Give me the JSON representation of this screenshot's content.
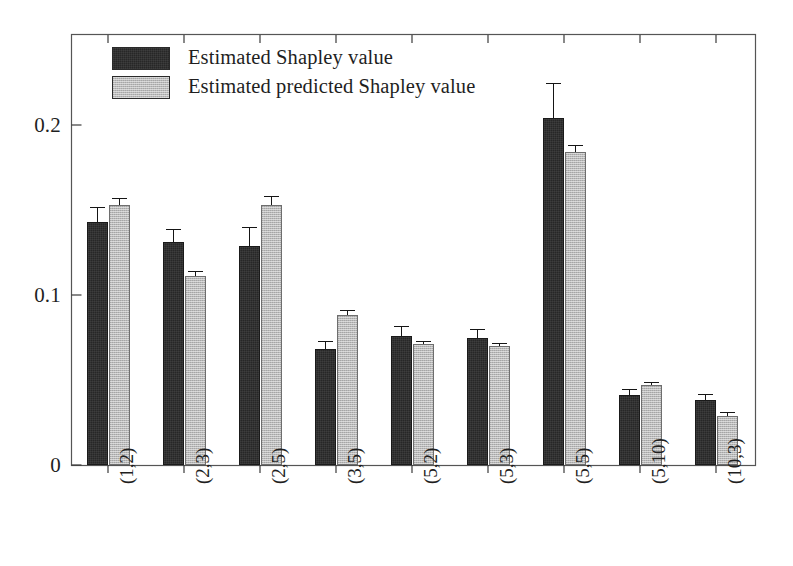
{
  "chart_data": {
    "type": "bar",
    "title": "",
    "xlabel": "",
    "ylabel": "",
    "ylim": [
      0,
      0.235
    ],
    "yticks": [
      0,
      0.1,
      0.2
    ],
    "ytick_labels": [
      "0",
      "0.1",
      "0.2"
    ],
    "grid": false,
    "legend_position": "top-left inside axes",
    "categories": [
      "(1,2)",
      "(2,3)",
      "(2,5)",
      "(3,5)",
      "(5,2)",
      "(5,3)",
      "(5,5)",
      "(5,10)",
      "(10,3)"
    ],
    "series": [
      {
        "name": "Estimated Shapley value",
        "color": "#272727",
        "values": [
          0.143,
          0.131,
          0.129,
          0.068,
          0.076,
          0.075,
          0.204,
          0.041,
          0.038
        ],
        "errors": [
          0.009,
          0.008,
          0.011,
          0.005,
          0.006,
          0.005,
          0.021,
          0.004,
          0.004
        ]
      },
      {
        "name": "Estimated predicted Shapley value",
        "color": "#b9b9b9",
        "values": [
          0.153,
          0.111,
          0.153,
          0.088,
          0.071,
          0.07,
          0.184,
          0.047,
          0.029
        ],
        "errors": [
          0.004,
          0.003,
          0.005,
          0.003,
          0.002,
          0.002,
          0.004,
          0.002,
          0.002
        ]
      }
    ]
  },
  "legend": {
    "entries": [
      {
        "label": "Estimated Shapley value",
        "swatch": "#272727"
      },
      {
        "label": "Estimated predicted Shapley value",
        "swatch": "#b9b9b9"
      }
    ]
  },
  "axes": {
    "y_tick_labels": [
      "0.2",
      "0.1",
      "0"
    ],
    "x_tick_labels": [
      "(1,2)",
      "(2,3)",
      "(2,5)",
      "(3,5)",
      "(5,2)",
      "(5,3)",
      "(5,5)",
      "(5,10)",
      "(10,3)"
    ]
  }
}
